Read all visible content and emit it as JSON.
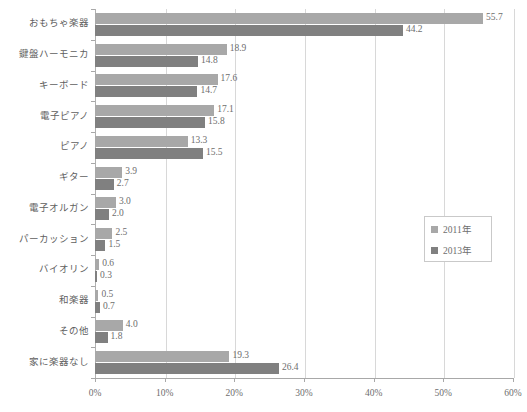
{
  "chart_data": {
    "type": "bar",
    "orientation": "horizontal",
    "title": "",
    "subtitle": "",
    "xlabel": "",
    "ylabel": "",
    "xlim": [
      0,
      60
    ],
    "xtick_labels": [
      "0%",
      "10%",
      "20%",
      "30%",
      "40%",
      "50%",
      "60%"
    ],
    "xtick_values": [
      0,
      10,
      20,
      30,
      40,
      50,
      60
    ],
    "grid": true,
    "grid_axis": "x",
    "legend_position": "center-right",
    "categories": [
      "おもちゃ楽器",
      "鍵盤ハーモニカ",
      "キーボード",
      "電子ピアノ",
      "ピアノ",
      "ギター",
      "電子オルガン",
      "パーカッション",
      "バイオリン",
      "和楽器",
      "その他",
      "家に楽器なし"
    ],
    "series": [
      {
        "name": "2011年",
        "color": "#a8a8a8",
        "values": [
          55.7,
          18.9,
          17.6,
          17.1,
          13.3,
          3.9,
          3.0,
          2.5,
          0.6,
          0.5,
          4.0,
          19.3
        ],
        "labels": [
          "55.7",
          "18.9",
          "17.6",
          "17.1",
          "13.3",
          "3.9",
          "3.0",
          "2.5",
          "0.6",
          "0.5",
          "4.0",
          "19.3"
        ]
      },
      {
        "name": "2013年",
        "color": "#808080",
        "values": [
          44.2,
          14.8,
          14.7,
          15.8,
          15.5,
          2.7,
          2.0,
          1.5,
          0.3,
          0.7,
          1.8,
          26.4
        ],
        "labels": [
          "44.2",
          "14.8",
          "14.7",
          "15.8",
          "15.5",
          "2.7",
          "2.0",
          "1.5",
          "0.3",
          "0.7",
          "1.8",
          "26.4"
        ]
      }
    ]
  },
  "legend": {
    "items": [
      {
        "label": "2011年",
        "color": "#a8a8a8"
      },
      {
        "label": "2013年",
        "color": "#808080"
      }
    ]
  }
}
